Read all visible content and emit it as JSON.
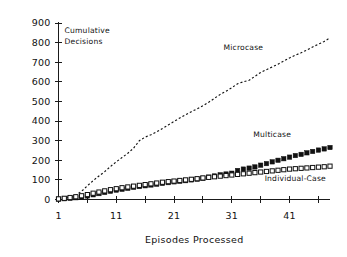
{
  "chart_data": {
    "type": "line",
    "title": "",
    "xlabel": "Episodes Processed",
    "ylabel": "Cumulative Decisions",
    "ylabel_line1": "Cumulative",
    "ylabel_line2": "Decisions",
    "xlim": [
      1,
      48
    ],
    "ylim": [
      0,
      900
    ],
    "grid": false,
    "legend_position": "inline-annotations",
    "ytick_labels": [
      "0",
      "100",
      "200",
      "300",
      "400",
      "500",
      "600",
      "700",
      "800",
      "900"
    ],
    "ytick_values": [
      0,
      100,
      200,
      300,
      400,
      500,
      600,
      700,
      800,
      900
    ],
    "xtick_labels": [
      "1",
      "11",
      "21",
      "31",
      "41"
    ],
    "xtick_values": [
      1,
      11,
      21,
      31,
      41
    ],
    "xminor_tick_values": [
      1,
      6,
      11,
      16,
      21,
      26,
      31,
      36,
      41,
      46
    ],
    "x": [
      1,
      2,
      3,
      4,
      5,
      6,
      7,
      8,
      9,
      10,
      11,
      12,
      13,
      14,
      15,
      16,
      17,
      18,
      19,
      20,
      21,
      22,
      23,
      24,
      25,
      26,
      27,
      28,
      29,
      30,
      31,
      32,
      33,
      34,
      35,
      36,
      37,
      38,
      39,
      40,
      41,
      42,
      43,
      44,
      45,
      46,
      47,
      48
    ],
    "series": [
      {
        "name": "Microcase",
        "marker": "none",
        "linestyle": "dotted",
        "color": "#111111",
        "label_x": 33,
        "label_y": 760,
        "values": [
          4,
          8,
          14,
          22,
          42,
          70,
          96,
          120,
          142,
          168,
          192,
          214,
          236,
          262,
          300,
          318,
          330,
          345,
          362,
          380,
          398,
          416,
          432,
          448,
          462,
          478,
          496,
          516,
          536,
          552,
          570,
          590,
          600,
          608,
          628,
          648,
          662,
          676,
          690,
          706,
          722,
          736,
          748,
          762,
          778,
          792,
          806,
          824
        ]
      },
      {
        "name": "Multicase",
        "marker": "filled-square",
        "linestyle": "none",
        "color": "#111111",
        "label_x": 38,
        "label_y": 320,
        "values": [
          2,
          4,
          6,
          9,
          13,
          18,
          24,
          30,
          36,
          42,
          48,
          52,
          57,
          62,
          66,
          70,
          74,
          78,
          82,
          86,
          90,
          93,
          96,
          100,
          104,
          108,
          114,
          120,
          126,
          130,
          134,
          148,
          155,
          160,
          166,
          175,
          183,
          192,
          200,
          208,
          216,
          224,
          230,
          238,
          245,
          252,
          258,
          265
        ]
      },
      {
        "name": "Individual-Case",
        "marker": "open-square",
        "linestyle": "none",
        "color": "#111111",
        "label_x": 42,
        "label_y": 95,
        "values": [
          3,
          6,
          10,
          14,
          19,
          25,
          32,
          38,
          44,
          50,
          55,
          60,
          64,
          68,
          72,
          76,
          80,
          84,
          88,
          91,
          94,
          97,
          100,
          103,
          106,
          110,
          113,
          116,
          119,
          122,
          125,
          128,
          131,
          134,
          137,
          140,
          143,
          146,
          149,
          152,
          155,
          157,
          159,
          161,
          163,
          165,
          167,
          170
        ]
      }
    ]
  }
}
